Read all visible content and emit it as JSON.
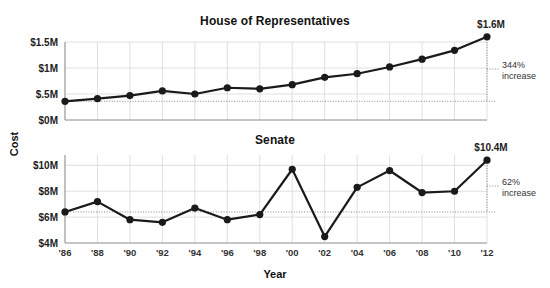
{
  "chart_data": [
    {
      "type": "line",
      "title": "House of Representatives",
      "xlabel": "Year",
      "ylabel": "Cost",
      "x": [
        "'86",
        "'88",
        "'90",
        "'92",
        "'94",
        "'96",
        "'98",
        "'00",
        "'02",
        "'04",
        "'06",
        "'08",
        "'10",
        "'12"
      ],
      "values": [
        0.36,
        0.41,
        0.47,
        0.56,
        0.5,
        0.62,
        0.6,
        0.68,
        0.82,
        0.89,
        1.02,
        1.17,
        1.34,
        1.6
      ],
      "ylim": [
        0,
        1.5
      ],
      "yticks": [
        0,
        0.5,
        1.0,
        1.5
      ],
      "ytick_labels": [
        "$0M",
        "$.5M",
        "$1M",
        "$1.5M"
      ],
      "grid": true,
      "end_value_label": "$1.6M",
      "annotation": "344%\nincrease",
      "annotation_line1": "344%",
      "annotation_line2": "increase",
      "baseline_value": 0.36,
      "legend": "none"
    },
    {
      "type": "line",
      "title": "Senate",
      "xlabel": "Year",
      "ylabel": "Cost",
      "x": [
        "'86",
        "'88",
        "'90",
        "'92",
        "'94",
        "'96",
        "'98",
        "'00",
        "'02",
        "'04",
        "'06",
        "'08",
        "'10",
        "'12"
      ],
      "values": [
        6.4,
        7.2,
        5.8,
        5.6,
        6.7,
        5.8,
        6.2,
        9.7,
        4.5,
        8.3,
        9.6,
        7.9,
        8.0,
        10.4
      ],
      "ylim": [
        4,
        10.8
      ],
      "yticks": [
        4,
        6,
        8,
        10
      ],
      "ytick_labels": [
        "$4M",
        "$6M",
        "$8M",
        "$10M"
      ],
      "grid": true,
      "end_value_label": "$10.4M",
      "annotation": "62%\nincrease",
      "annotation_line1": "62%",
      "annotation_line2": "increase",
      "baseline_value": 6.4,
      "legend": "none"
    }
  ],
  "style": {
    "line_color": "#1a1a1a",
    "marker_color": "#1a1a1a",
    "grid_color": "#d8d8dc",
    "axis_color": "#9a9a9e",
    "dotted_color": "#8a8a8e",
    "background": "#ffffff"
  },
  "axes": {
    "ylabel": "Cost",
    "xlabel": "Year"
  }
}
